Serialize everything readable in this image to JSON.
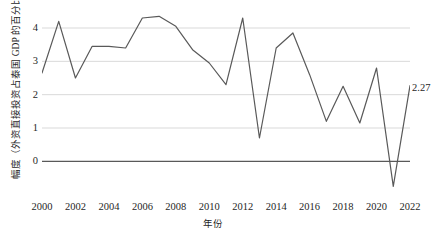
{
  "chart_data": {
    "type": "line",
    "title": "",
    "xlabel": "年份",
    "ylabel": "幅度（外资直接投资占泰国 GDP 的百分比）",
    "x": [
      2000,
      2001,
      2002,
      2003,
      2004,
      2005,
      2006,
      2007,
      2008,
      2009,
      2010,
      2011,
      2012,
      2013,
      2014,
      2015,
      2016,
      2017,
      2018,
      2019,
      2020,
      2021,
      2022
    ],
    "values": [
      2.65,
      4.2,
      2.5,
      3.45,
      3.45,
      3.4,
      4.3,
      4.35,
      4.05,
      3.35,
      2.95,
      2.3,
      4.3,
      0.7,
      3.4,
      3.85,
      2.6,
      1.2,
      2.25,
      1.15,
      2.8,
      -0.75,
      2.27
    ],
    "series": [
      {
        "name": "外资直接投资占泰国 GDP 的百分比",
        "values": [
          2.65,
          4.2,
          2.5,
          3.45,
          3.45,
          3.4,
          4.3,
          4.35,
          4.05,
          3.35,
          2.95,
          2.3,
          4.3,
          0.7,
          3.4,
          3.85,
          2.6,
          1.2,
          2.25,
          1.15,
          2.8,
          -0.75,
          2.27
        ],
        "color": "#595959"
      }
    ],
    "yticks": [
      0,
      1,
      2,
      3,
      4
    ],
    "ytick_labels": [
      "0",
      "1",
      "2",
      "3",
      "4"
    ],
    "ylim": [
      -1.1,
      4.6
    ],
    "xlim": [
      2000,
      2022
    ],
    "xticks": [
      2000,
      2002,
      2004,
      2006,
      2008,
      2010,
      2012,
      2014,
      2016,
      2018,
      2020,
      2022
    ],
    "xtick_labels": [
      "2000",
      "2002",
      "2004",
      "2006",
      "2008",
      "2010",
      "2012",
      "2014",
      "2016",
      "2018",
      "2020",
      "2022"
    ],
    "grid": true,
    "grid_axis": "y",
    "grid_color": "#d9d9d9",
    "zero_line_color": "#595959",
    "legend": "none",
    "annotations": [
      {
        "text": "2.27",
        "x": 2022,
        "y": 2.27
      }
    ]
  },
  "labels": {
    "end_point_value": "2.27",
    "x_axis_title": "年份",
    "y_axis_title": "幅度（外资直接投资占泰国 GDP 的百分比）"
  }
}
